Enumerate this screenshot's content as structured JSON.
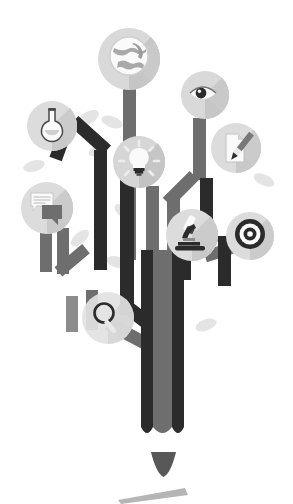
{
  "illustration": {
    "title": "Knowledge Tree Infographic",
    "description": "Flat grayscale illustration of a tree whose angular branches end in circular icon badges representing ideas, research and communication.",
    "background_color": "#ffffff",
    "palette": {
      "branch_dark": "#2b2b2b",
      "branch_mid": "#6e6e6e",
      "branch_light": "#8c8c8c",
      "badge_fill": "#d6d6d6",
      "badge_fill_light": "#e2e2e2",
      "badge_shadow": "#bcbcbc",
      "icon_white": "#fafafa",
      "icon_dark": "#2b2b2b",
      "leaf": "#e4e4e4",
      "ground": "#b5b5b5"
    }
  },
  "badges": [
    {
      "id": "globe",
      "name": "globe-icon",
      "label": "Global",
      "cx": 129,
      "cy": 59,
      "r": 31
    },
    {
      "id": "eye",
      "name": "eye-icon",
      "label": "Vision",
      "cx": 205,
      "cy": 95,
      "r": 24
    },
    {
      "id": "flask",
      "name": "flask-icon",
      "label": "Experiment",
      "cx": 52,
      "cy": 126,
      "r": 25
    },
    {
      "id": "document-pen",
      "name": "document-pen-icon",
      "label": "Write",
      "cx": 236,
      "cy": 148,
      "r": 25
    },
    {
      "id": "lightbulb",
      "name": "lightbulb-icon",
      "label": "Idea",
      "cx": 139,
      "cy": 162,
      "r": 26
    },
    {
      "id": "chat",
      "name": "chat-bubble-icon",
      "label": "Discuss",
      "cx": 47,
      "cy": 208,
      "r": 26
    },
    {
      "id": "microscope",
      "name": "microscope-icon",
      "label": "Research",
      "cx": 192,
      "cy": 235,
      "r": 26
    },
    {
      "id": "target",
      "name": "target-icon",
      "label": "Goal",
      "cx": 250,
      "cy": 236,
      "r": 24
    },
    {
      "id": "magnifier",
      "name": "magnifier-icon",
      "label": "Search",
      "cx": 108,
      "cy": 318,
      "r": 26
    }
  ],
  "leaves": [
    {
      "name": "leaf-shape",
      "cx": 88,
      "cy": 118,
      "rot": -30
    },
    {
      "name": "leaf-shape",
      "cx": 110,
      "cy": 120,
      "rot": 20
    },
    {
      "name": "leaf-shape",
      "cx": 34,
      "cy": 165,
      "rot": -15
    },
    {
      "name": "leaf-shape",
      "cx": 124,
      "cy": 212,
      "rot": 35
    },
    {
      "name": "leaf-shape",
      "cx": 80,
      "cy": 236,
      "rot": -40
    },
    {
      "name": "leaf-shape",
      "cx": 117,
      "cy": 262,
      "rot": 15
    },
    {
      "name": "leaf-shape",
      "cx": 206,
      "cy": 325,
      "rot": -20
    },
    {
      "name": "leaf-shape",
      "cx": 264,
      "cy": 180,
      "rot": 25
    }
  ],
  "trunk": {
    "name": "tree-trunk",
    "bands": [
      {
        "name": "trunk-band-left",
        "x": 141,
        "width": 12,
        "color": "#2b2b2b"
      },
      {
        "name": "trunk-band-center",
        "x": 153,
        "width": 19,
        "color": "#6e6e6e"
      },
      {
        "name": "trunk-band-right",
        "x": 172,
        "width": 12,
        "color": "#2b2b2b"
      }
    ],
    "top": 250,
    "bottom": 435
  },
  "ground": {
    "triangle_name": "root-triangle",
    "bar_name": "ground-bar"
  }
}
